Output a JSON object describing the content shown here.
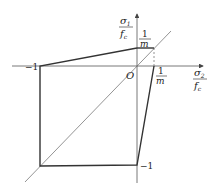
{
  "diagram": {
    "type": "biaxial failure envelope",
    "x_axis_label": {
      "numerator": "σ₂",
      "denominator": "f꜀",
      "num_text": "σ",
      "num_sub": "2",
      "den_text": "f",
      "den_sub": "c"
    },
    "y_axis_label": {
      "numerator": "σ₁",
      "denominator": "f꜀",
      "num_text": "σ",
      "num_sub": "1",
      "den_text": "f",
      "den_sub": "c"
    },
    "origin_label": "O",
    "tick_labels": {
      "x_neg": "−1",
      "y_neg": "−1",
      "y_pos_num": "1",
      "y_pos_den": "m",
      "x_pos_num": "1",
      "x_pos_den": "m"
    },
    "colors": {
      "envelope": "#333333",
      "axis": "#555555",
      "diagonal": "#666666"
    }
  }
}
